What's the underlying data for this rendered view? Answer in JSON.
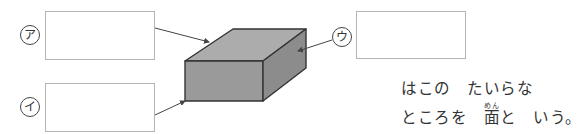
{
  "labels": {
    "a": "ア",
    "i": "イ",
    "u": "ウ"
  },
  "answer_boxes": [
    {
      "id": "a",
      "value": ""
    },
    {
      "id": "i",
      "value": ""
    },
    {
      "id": "u",
      "value": ""
    }
  ],
  "shape": {
    "type": "rectangular-prism",
    "colors": {
      "top": "#acacac",
      "front": "#9a9a9a",
      "right": "#8c8c8c",
      "edge": "#333333"
    }
  },
  "caption": {
    "line1": "はこの　たいらな",
    "line2_before": "ところを　",
    "kanji": "面",
    "ruby": "めん",
    "line2_after": "と　いう。"
  }
}
